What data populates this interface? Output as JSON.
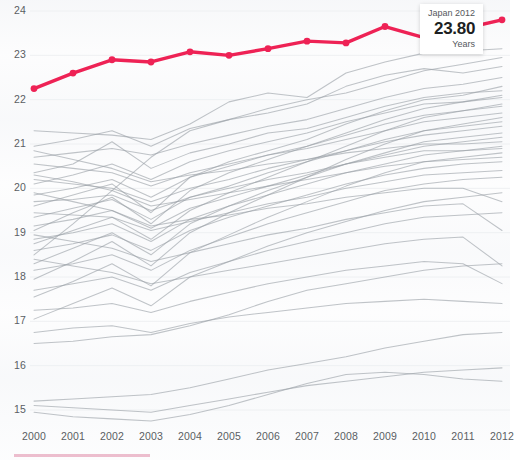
{
  "chart_data": {
    "type": "line",
    "title": "",
    "subtitle": "",
    "xlabel": "",
    "ylabel": "",
    "unit": "Years",
    "grid": false,
    "legend_position": "none",
    "x": [
      2000,
      2001,
      2002,
      2003,
      2004,
      2005,
      2006,
      2007,
      2008,
      2009,
      2010,
      2011,
      2012
    ],
    "xlim": [
      2000,
      2012
    ],
    "ylim": [
      14.75,
      24.25
    ],
    "y_ticks": [
      15,
      16,
      17,
      18,
      19,
      20,
      21,
      22,
      23,
      24
    ],
    "x_tick_labels": [
      "2000",
      "2001",
      "2002",
      "2003",
      "2004",
      "2005",
      "2006",
      "2007",
      "2008",
      "2009",
      "2010",
      "2011",
      "2012"
    ],
    "highlight_series": {
      "name": "Japan",
      "color": "#EE2255",
      "marker": "circle",
      "values": [
        22.25,
        22.6,
        22.9,
        22.85,
        23.08,
        23.0,
        23.15,
        23.32,
        23.28,
        23.65,
        23.4,
        23.6,
        23.8
      ]
    },
    "background_series": [
      {
        "name": "series-01",
        "values": [
          21.3,
          21.25,
          21.2,
          21.1,
          21.45,
          21.95,
          22.15,
          22.05,
          22.6,
          22.85,
          23.05,
          23.1,
          23.15
        ]
      },
      {
        "name": "series-02",
        "values": [
          20.95,
          21.1,
          21.3,
          20.95,
          21.35,
          21.55,
          21.8,
          22.0,
          22.15,
          22.4,
          22.65,
          22.8,
          22.95
        ]
      },
      {
        "name": "series-03",
        "values": [
          18.5,
          19.2,
          19.95,
          20.7,
          21.3,
          21.55,
          21.7,
          21.9,
          22.3,
          22.55,
          22.7,
          22.6,
          22.75
        ]
      },
      {
        "name": "series-04",
        "values": [
          20.7,
          20.8,
          20.9,
          20.75,
          21.0,
          21.2,
          21.4,
          21.55,
          21.8,
          22.05,
          22.25,
          22.35,
          22.5
        ]
      },
      {
        "name": "series-05",
        "values": [
          19.6,
          19.85,
          20.1,
          19.45,
          20.25,
          20.6,
          20.85,
          21.1,
          21.45,
          21.75,
          22.0,
          22.1,
          22.3
        ]
      },
      {
        "name": "series-06",
        "values": [
          20.35,
          20.55,
          21.05,
          20.45,
          20.8,
          21.0,
          21.25,
          21.35,
          21.6,
          21.85,
          22.05,
          22.15,
          22.2
        ]
      },
      {
        "name": "series-07",
        "values": [
          19.05,
          19.45,
          19.8,
          19.2,
          19.95,
          20.35,
          20.65,
          20.95,
          21.25,
          21.55,
          21.8,
          21.95,
          22.1
        ]
      },
      {
        "name": "series-08",
        "values": [
          20.1,
          20.3,
          20.55,
          20.2,
          20.6,
          20.85,
          21.05,
          21.25,
          21.5,
          21.7,
          21.9,
          21.95,
          22.05
        ]
      },
      {
        "name": "series-09",
        "values": [
          18.75,
          19.05,
          19.35,
          18.85,
          19.5,
          19.9,
          20.25,
          20.6,
          20.95,
          21.3,
          21.6,
          21.75,
          21.9
        ]
      },
      {
        "name": "series-10",
        "values": [
          19.85,
          20.0,
          20.2,
          19.8,
          20.25,
          20.5,
          20.75,
          20.95,
          21.2,
          21.45,
          21.65,
          21.75,
          21.85
        ]
      },
      {
        "name": "series-11",
        "values": [
          20.55,
          20.45,
          20.35,
          20.05,
          20.35,
          20.55,
          20.75,
          20.9,
          21.1,
          21.3,
          21.5,
          21.6,
          21.7
        ]
      },
      {
        "name": "series-12",
        "values": [
          17.95,
          18.35,
          18.8,
          18.25,
          19.0,
          19.45,
          19.85,
          20.25,
          20.65,
          21.0,
          21.3,
          21.45,
          21.6
        ]
      },
      {
        "name": "series-13",
        "values": [
          19.35,
          19.55,
          19.75,
          19.3,
          19.8,
          20.05,
          20.35,
          20.6,
          20.85,
          21.1,
          21.3,
          21.4,
          21.5
        ]
      },
      {
        "name": "series-14",
        "values": [
          20.2,
          20.1,
          20.0,
          19.7,
          20.0,
          20.2,
          20.45,
          20.65,
          20.85,
          21.05,
          21.2,
          21.3,
          21.4
        ]
      },
      {
        "name": "series-15",
        "values": [
          18.3,
          18.65,
          19.0,
          18.5,
          19.2,
          19.6,
          19.95,
          20.25,
          20.55,
          20.8,
          21.05,
          21.15,
          21.25
        ]
      },
      {
        "name": "series-16",
        "values": [
          19.15,
          19.3,
          19.5,
          19.1,
          19.55,
          19.8,
          20.05,
          20.3,
          20.55,
          20.75,
          20.95,
          21.05,
          21.15
        ]
      },
      {
        "name": "series-17",
        "values": [
          20.85,
          20.65,
          20.45,
          20.15,
          20.3,
          20.4,
          20.55,
          20.65,
          20.8,
          20.9,
          21.0,
          21.0,
          21.05
        ]
      },
      {
        "name": "series-18",
        "values": [
          18.85,
          19.0,
          19.2,
          18.8,
          19.3,
          19.6,
          19.85,
          20.1,
          20.35,
          20.55,
          20.75,
          20.85,
          20.95
        ]
      },
      {
        "name": "series-19",
        "values": [
          19.7,
          19.75,
          19.85,
          19.5,
          19.8,
          20.0,
          20.2,
          20.35,
          20.55,
          20.7,
          20.85,
          20.85,
          20.9
        ]
      },
      {
        "name": "series-20",
        "values": [
          17.55,
          17.9,
          18.3,
          17.8,
          18.55,
          18.95,
          19.35,
          19.7,
          20.05,
          20.35,
          20.6,
          20.7,
          20.8
        ]
      },
      {
        "name": "series-21",
        "values": [
          20.3,
          20.15,
          19.95,
          19.6,
          19.75,
          19.9,
          20.05,
          20.2,
          20.35,
          20.5,
          20.6,
          20.65,
          20.7
        ]
      },
      {
        "name": "series-22",
        "values": [
          18.6,
          18.75,
          18.95,
          18.6,
          19.05,
          19.35,
          19.6,
          19.85,
          20.1,
          20.3,
          20.45,
          20.55,
          20.6
        ]
      },
      {
        "name": "series-23",
        "values": [
          19.45,
          19.4,
          19.35,
          19.05,
          19.25,
          19.45,
          19.65,
          19.8,
          20.0,
          20.15,
          20.3,
          20.35,
          20.4
        ]
      },
      {
        "name": "series-24",
        "values": [
          18.15,
          18.3,
          18.5,
          18.15,
          18.6,
          18.9,
          19.2,
          19.45,
          19.7,
          19.95,
          20.1,
          20.2,
          20.25
        ]
      },
      {
        "name": "series-25",
        "values": [
          19.9,
          19.7,
          19.5,
          19.15,
          19.3,
          19.4,
          19.55,
          19.65,
          19.8,
          19.9,
          20.0,
          20.0,
          19.7
        ]
      },
      {
        "name": "series-26",
        "values": [
          17.05,
          17.4,
          17.75,
          17.35,
          18.0,
          18.35,
          18.7,
          19.0,
          19.25,
          19.5,
          19.7,
          19.8,
          19.9
        ]
      },
      {
        "name": "series-27",
        "values": [
          18.95,
          18.8,
          18.65,
          18.35,
          18.55,
          18.75,
          18.95,
          19.1,
          19.3,
          19.45,
          19.6,
          19.65,
          19.05
        ]
      },
      {
        "name": "series-28",
        "values": [
          17.7,
          17.85,
          18.0,
          17.7,
          18.1,
          18.35,
          18.6,
          18.8,
          19.0,
          19.2,
          19.35,
          19.4,
          19.45
        ]
      },
      {
        "name": "series-29",
        "values": [
          18.4,
          18.25,
          18.1,
          17.85,
          18.0,
          18.15,
          18.3,
          18.45,
          18.6,
          18.75,
          18.85,
          18.9,
          18.25
        ]
      },
      {
        "name": "series-30",
        "values": [
          16.5,
          16.55,
          16.65,
          16.7,
          16.9,
          17.15,
          17.45,
          17.7,
          17.85,
          18.0,
          18.15,
          18.25,
          18.3
        ]
      },
      {
        "name": "series-31",
        "values": [
          17.25,
          17.3,
          17.4,
          17.2,
          17.45,
          17.65,
          17.85,
          18.0,
          18.15,
          18.25,
          18.35,
          18.3,
          17.85
        ]
      },
      {
        "name": "series-32",
        "values": [
          15.2,
          15.25,
          15.3,
          15.35,
          15.5,
          15.7,
          15.9,
          16.05,
          16.2,
          16.4,
          16.55,
          16.7,
          16.75
        ]
      },
      {
        "name": "series-33",
        "values": [
          15.1,
          15.05,
          15.0,
          14.95,
          15.1,
          15.25,
          15.4,
          15.55,
          15.65,
          15.75,
          15.85,
          15.9,
          15.95
        ]
      },
      {
        "name": "series-34",
        "values": [
          14.95,
          14.85,
          14.8,
          14.75,
          14.9,
          15.1,
          15.35,
          15.6,
          15.8,
          15.85,
          15.8,
          15.7,
          15.65
        ]
      },
      {
        "name": "series-35",
        "values": [
          16.75,
          16.85,
          16.9,
          16.75,
          16.95,
          17.1,
          17.2,
          17.3,
          17.4,
          17.45,
          17.5,
          17.45,
          17.4
        ]
      }
    ]
  },
  "tooltip": {
    "title": "Japan 2012",
    "value": "23.80",
    "unit": "Years"
  },
  "style": {
    "highlight_color": "#EE2255",
    "background_line_color": "#9aa0a6",
    "axis_text_color": "#5a5e63",
    "bottom_bar_color": "#e7a8bd"
  }
}
